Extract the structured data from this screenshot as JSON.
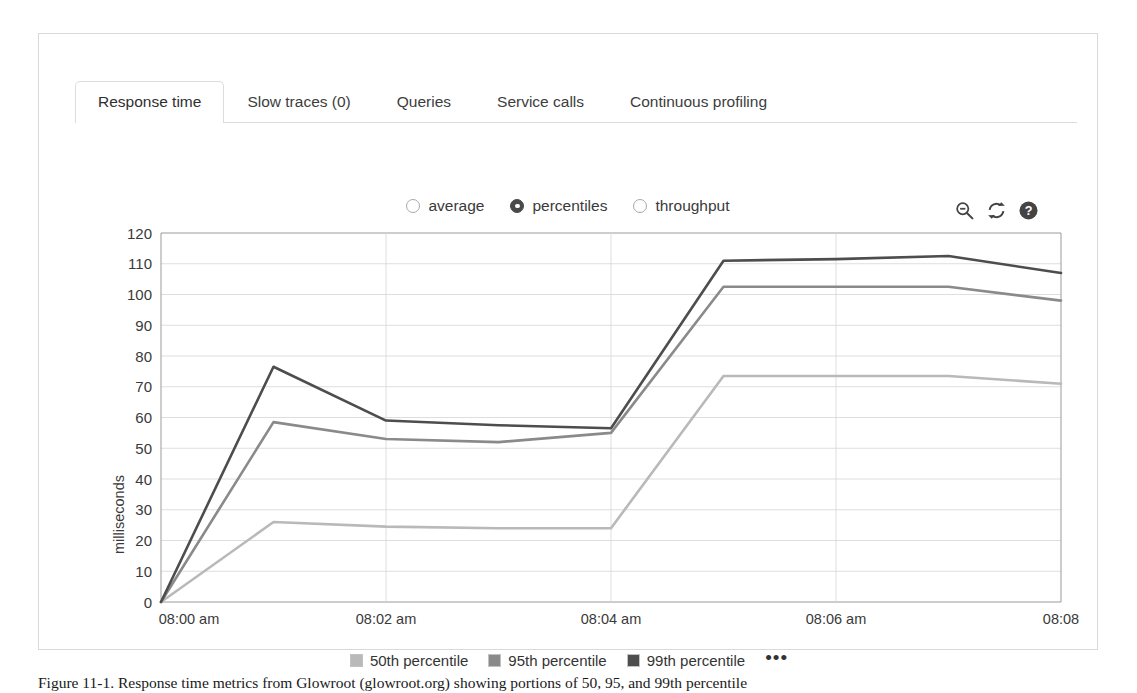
{
  "tabs": [
    {
      "label": "Response time",
      "active": true
    },
    {
      "label": "Slow traces (0)",
      "active": false
    },
    {
      "label": "Queries",
      "active": false
    },
    {
      "label": "Service calls",
      "active": false
    },
    {
      "label": "Continuous profiling",
      "active": false
    }
  ],
  "metric_modes": [
    {
      "label": "average",
      "checked": false
    },
    {
      "label": "percentiles",
      "checked": true
    },
    {
      "label": "throughput",
      "checked": false
    }
  ],
  "toolbar": {
    "zoom_out_icon": "zoom-out-icon",
    "refresh_icon": "refresh-icon",
    "help_icon": "help-icon"
  },
  "legend": {
    "more_label": "•••",
    "items": [
      {
        "label": "50th percentile",
        "color": "#b9b9b9"
      },
      {
        "label": "95th percentile",
        "color": "#8a8a8a"
      },
      {
        "label": "99th percentile",
        "color": "#4d4d4d"
      }
    ]
  },
  "caption": {
    "text": "Figure 11-1. Response time metrics from Glowroot (glowroot.org) showing portions of 50, 95, and 99th percentile"
  },
  "chart_data": {
    "type": "line",
    "title": "",
    "xlabel": "",
    "ylabel": "milliseconds",
    "ylim": [
      0,
      120
    ],
    "ytick_values": [
      0,
      10,
      20,
      30,
      40,
      50,
      60,
      70,
      80,
      90,
      100,
      110,
      120
    ],
    "xtick_labels": [
      "08:00 am",
      "08:02 am",
      "08:04 am",
      "08:06 am",
      "08:08 am"
    ],
    "xtick_last_wrapped": [
      "08:08",
      "am"
    ],
    "x_minutes": [
      0,
      1,
      2,
      3,
      4,
      5,
      6,
      7,
      8
    ],
    "grid": true,
    "legend_position": "bottom",
    "series": [
      {
        "name": "50th percentile",
        "color": "#b9b9b9",
        "values": [
          0,
          26,
          24.5,
          24,
          24,
          73.5,
          73.5,
          73.5,
          71
        ]
      },
      {
        "name": "95th percentile",
        "color": "#8a8a8a",
        "values": [
          0,
          58.5,
          53,
          52,
          55,
          102.5,
          102.5,
          102.5,
          98
        ]
      },
      {
        "name": "99th percentile",
        "color": "#4d4d4d",
        "values": [
          0,
          76.5,
          59,
          57.5,
          56.5,
          111,
          111.5,
          112.5,
          107
        ]
      }
    ]
  }
}
